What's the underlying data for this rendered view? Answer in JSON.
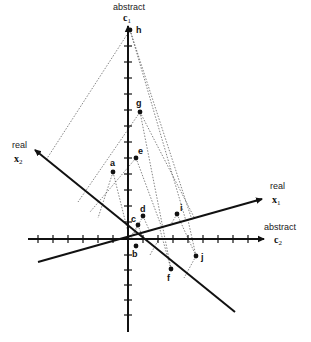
{
  "diagram": {
    "origin": [
      128,
      239
    ],
    "axes": {
      "c1": {
        "label_top": "abstract",
        "symbol": "c",
        "subscript": "1",
        "from": [
          128,
          332
        ],
        "to": [
          128,
          22
        ]
      },
      "c2": {
        "label_top": "abstract",
        "symbol": "c",
        "subscript": "2",
        "from": [
          28,
          239
        ],
        "to": [
          268,
          239
        ]
      },
      "x1": {
        "label_top": "real",
        "symbol": "x",
        "subscript": "1",
        "from": [
          38,
          262
        ],
        "to": [
          265,
          198
        ]
      },
      "x2": {
        "label_top": "real",
        "symbol": "x",
        "subscript": "2",
        "from": [
          235,
          312
        ],
        "to": [
          32,
          148
        ]
      }
    },
    "points": [
      {
        "id": "h",
        "label": "h",
        "x": 130,
        "y": 30
      },
      {
        "id": "g",
        "label": "g",
        "x": 140,
        "y": 112
      },
      {
        "id": "e",
        "label": "e",
        "x": 136,
        "y": 158
      },
      {
        "id": "a",
        "label": "a",
        "x": 113,
        "y": 172
      },
      {
        "id": "i",
        "label": "i",
        "x": 177,
        "y": 214
      },
      {
        "id": "d",
        "label": "d",
        "x": 143,
        "y": 216
      },
      {
        "id": "c",
        "label": "c",
        "x": 138,
        "y": 225
      },
      {
        "id": "b",
        "label": "b",
        "x": 136,
        "y": 246
      },
      {
        "id": "j",
        "label": "j",
        "x": 196,
        "y": 256
      },
      {
        "id": "f",
        "label": "f",
        "x": 171,
        "y": 269
      }
    ]
  }
}
